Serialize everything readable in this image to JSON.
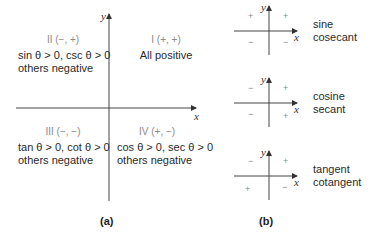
{
  "panel_a": {
    "caption": "(a)",
    "axes": {
      "x_label": "x",
      "y_label": "y"
    },
    "quadrants": [
      {
        "id": "I",
        "label": "I (+, +)",
        "line1": "All positive",
        "line2": ""
      },
      {
        "id": "II",
        "label": "II (−, +)",
        "line1": "sin θ > 0, csc θ > 0",
        "line2": "others negative"
      },
      {
        "id": "III",
        "label": "III (−, −)",
        "line1": "tan θ > 0, cot θ > 0",
        "line2": "others negative"
      },
      {
        "id": "IV",
        "label": "IV (+, −)",
        "line1": "cos θ > 0, sec θ > 0",
        "line2": "others negative"
      }
    ]
  },
  "panel_b": {
    "caption": "(b)",
    "diagrams": [
      {
        "functions": [
          "sine",
          "cosecant"
        ],
        "signs": {
          "I": "+",
          "II": "+",
          "III": "−",
          "IV": "−"
        },
        "x_label": "x",
        "y_label": "y"
      },
      {
        "functions": [
          "cosine",
          "secant"
        ],
        "signs": {
          "I": "+",
          "II": "−",
          "III": "−",
          "IV": "+"
        },
        "x_label": "x",
        "y_label": "y"
      },
      {
        "functions": [
          "tangent",
          "cotangent"
        ],
        "signs": {
          "I": "+",
          "II": "−",
          "III": "+",
          "IV": "−"
        },
        "x_label": "x",
        "y_label": "y"
      }
    ]
  }
}
